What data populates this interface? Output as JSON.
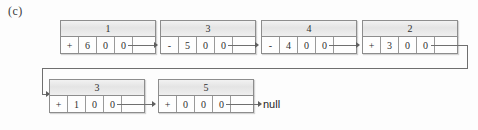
{
  "figure": {
    "label": "(c)"
  },
  "diagram": {
    "type": "linked-list",
    "terminator_label": "null",
    "nodes": [
      {
        "header": "1",
        "cells": [
          "+",
          "6",
          "0",
          "0",
          ""
        ]
      },
      {
        "header": "3",
        "cells": [
          "-",
          "5",
          "0",
          "0",
          ""
        ]
      },
      {
        "header": "4",
        "cells": [
          "-",
          "4",
          "0",
          "0",
          ""
        ]
      },
      {
        "header": "2",
        "cells": [
          "+",
          "3",
          "0",
          "0",
          ""
        ]
      },
      {
        "header": "3",
        "cells": [
          "+",
          "1",
          "0",
          "0",
          ""
        ]
      },
      {
        "header": "5",
        "cells": [
          "+",
          "0",
          "0",
          "0",
          ""
        ]
      }
    ]
  }
}
